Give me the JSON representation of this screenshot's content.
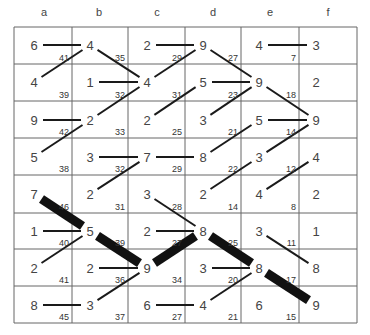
{
  "columns": [
    "a",
    "b",
    "c",
    "d",
    "e",
    "f"
  ],
  "grid": {
    "x": [
      14,
      72,
      128,
      185,
      241,
      299,
      357
    ],
    "y": [
      27,
      64,
      101,
      138,
      175,
      213,
      249,
      286,
      323
    ],
    "line_color": "#666666"
  },
  "node_x": [
    34,
    90,
    147,
    203,
    259,
    316
  ],
  "node_y": [
    45,
    82,
    120,
    157,
    194,
    231,
    268,
    305
  ],
  "rows": [
    {
      "values": [
        6,
        4,
        2,
        9,
        4,
        3
      ],
      "weights": [
        41,
        35,
        29,
        27,
        7
      ]
    },
    {
      "values": [
        4,
        1,
        4,
        5,
        9,
        2
      ],
      "weights": [
        39,
        32,
        31,
        23,
        18
      ]
    },
    {
      "values": [
        9,
        2,
        2,
        3,
        5,
        9
      ],
      "weights": [
        42,
        33,
        25,
        21,
        14
      ]
    },
    {
      "values": [
        5,
        3,
        7,
        8,
        3,
        4
      ],
      "weights": [
        38,
        32,
        29,
        22,
        12
      ]
    },
    {
      "values": [
        7,
        2,
        3,
        2,
        4,
        2
      ],
      "weights": [
        46,
        31,
        28,
        14,
        8
      ]
    },
    {
      "values": [
        1,
        5,
        2,
        8,
        3,
        1
      ],
      "weights": [
        40,
        39,
        27,
        25,
        11
      ]
    },
    {
      "values": [
        2,
        2,
        9,
        3,
        8,
        8
      ],
      "weights": [
        41,
        36,
        34,
        20,
        17
      ]
    },
    {
      "values": [
        8,
        3,
        6,
        4,
        6,
        9
      ],
      "weights": [
        45,
        37,
        27,
        21,
        15
      ]
    }
  ],
  "edges": [
    {
      "from": [
        0,
        0
      ],
      "to": [
        0,
        1
      ],
      "type": "thin"
    },
    {
      "from": [
        0,
        1
      ],
      "to": [
        1,
        2
      ],
      "type": "thin"
    },
    {
      "from": [
        0,
        2
      ],
      "to": [
        0,
        3
      ],
      "type": "thin"
    },
    {
      "from": [
        0,
        3
      ],
      "to": [
        1,
        4
      ],
      "type": "thin"
    },
    {
      "from": [
        0,
        4
      ],
      "to": [
        0,
        5
      ],
      "type": "thin"
    },
    {
      "from": [
        1,
        0
      ],
      "to": [
        0,
        1
      ],
      "type": "thin"
    },
    {
      "from": [
        1,
        2
      ],
      "to": [
        0,
        3
      ],
      "type": "thin"
    },
    {
      "from": [
        1,
        1
      ],
      "to": [
        1,
        2
      ],
      "type": "thin"
    },
    {
      "from": [
        1,
        3
      ],
      "to": [
        1,
        4
      ],
      "type": "thin"
    },
    {
      "from": [
        1,
        4
      ],
      "to": [
        2,
        5
      ],
      "type": "thin"
    },
    {
      "from": [
        2,
        1
      ],
      "to": [
        1,
        2
      ],
      "type": "thin"
    },
    {
      "from": [
        2,
        2
      ],
      "to": [
        1,
        3
      ],
      "type": "thin"
    },
    {
      "from": [
        2,
        3
      ],
      "to": [
        1,
        4
      ],
      "type": "thin"
    },
    {
      "from": [
        2,
        0
      ],
      "to": [
        2,
        1
      ],
      "type": "thin"
    },
    {
      "from": [
        2,
        4
      ],
      "to": [
        2,
        5
      ],
      "type": "thin"
    },
    {
      "from": [
        3,
        0
      ],
      "to": [
        2,
        1
      ],
      "type": "thin"
    },
    {
      "from": [
        3,
        3
      ],
      "to": [
        2,
        4
      ],
      "type": "thin"
    },
    {
      "from": [
        3,
        4
      ],
      "to": [
        2,
        5
      ],
      "type": "thin"
    },
    {
      "from": [
        3,
        1
      ],
      "to": [
        3,
        2
      ],
      "type": "thin"
    },
    {
      "from": [
        3,
        2
      ],
      "to": [
        3,
        3
      ],
      "type": "thin"
    },
    {
      "from": [
        4,
        1
      ],
      "to": [
        3,
        2
      ],
      "type": "thin"
    },
    {
      "from": [
        4,
        3
      ],
      "to": [
        3,
        4
      ],
      "type": "thin"
    },
    {
      "from": [
        4,
        4
      ],
      "to": [
        3,
        5
      ],
      "type": "thin"
    },
    {
      "from": [
        4,
        0
      ],
      "to": [
        5,
        1
      ],
      "type": "thick"
    },
    {
      "from": [
        4,
        2
      ],
      "to": [
        5,
        3
      ],
      "type": "thin"
    },
    {
      "from": [
        5,
        0
      ],
      "to": [
        5,
        1
      ],
      "type": "thin"
    },
    {
      "from": [
        5,
        1
      ],
      "to": [
        6,
        2
      ],
      "type": "thick"
    },
    {
      "from": [
        5,
        2
      ],
      "to": [
        5,
        3
      ],
      "type": "thin"
    },
    {
      "from": [
        5,
        3
      ],
      "to": [
        6,
        4
      ],
      "type": "thick"
    },
    {
      "from": [
        5,
        4
      ],
      "to": [
        6,
        5
      ],
      "type": "thin"
    },
    {
      "from": [
        6,
        0
      ],
      "to": [
        5,
        1
      ],
      "type": "thin"
    },
    {
      "from": [
        6,
        2
      ],
      "to": [
        5,
        3
      ],
      "type": "thick"
    },
    {
      "from": [
        6,
        1
      ],
      "to": [
        6,
        2
      ],
      "type": "thin"
    },
    {
      "from": [
        6,
        3
      ],
      "to": [
        6,
        4
      ],
      "type": "thin"
    },
    {
      "from": [
        6,
        4
      ],
      "to": [
        7,
        5
      ],
      "type": "thick"
    },
    {
      "from": [
        7,
        1
      ],
      "to": [
        6,
        2
      ],
      "type": "thin"
    },
    {
      "from": [
        7,
        3
      ],
      "to": [
        6,
        4
      ],
      "type": "thin"
    },
    {
      "from": [
        7,
        0
      ],
      "to": [
        7,
        1
      ],
      "type": "thin"
    },
    {
      "from": [
        7,
        2
      ],
      "to": [
        7,
        3
      ],
      "type": "thin"
    }
  ]
}
